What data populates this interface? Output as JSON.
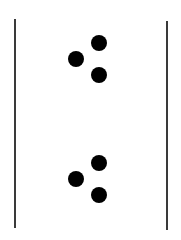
{
  "figure": {
    "line_color": "#3a3a3a",
    "dot_color": "#000000",
    "left_line": {
      "x": 15,
      "top": 19,
      "bottom": 228
    },
    "right_line": {
      "x": 167,
      "top": 21,
      "bottom": 230
    },
    "groups": [
      {
        "dots": [
          {
            "x": 99,
            "y": 43
          },
          {
            "x": 76,
            "y": 59
          },
          {
            "x": 99,
            "y": 75
          }
        ]
      },
      {
        "dots": [
          {
            "x": 99,
            "y": 163
          },
          {
            "x": 76,
            "y": 179
          },
          {
            "x": 99,
            "y": 195
          }
        ]
      }
    ]
  }
}
